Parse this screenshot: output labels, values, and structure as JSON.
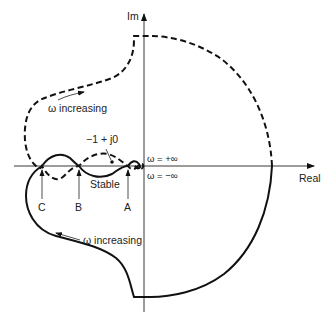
{
  "diagram": {
    "axes": {
      "imaginary_label": "Im",
      "real_label": "Real"
    },
    "annotations": {
      "omega_increasing_upper": "ω increasing",
      "omega_increasing_lower": "ω increasing",
      "critical_point": "−1 + j0",
      "omega_plus_inf": "ω = +∞",
      "omega_minus_inf": "ω = −∞",
      "stable_region": "Stable"
    },
    "crossing_points": [
      {
        "label": "C"
      },
      {
        "label": "B"
      },
      {
        "label": "A"
      }
    ],
    "curves": [
      {
        "name": "positive-frequency-branch",
        "style": "dashed"
      },
      {
        "name": "negative-frequency-branch",
        "style": "solid"
      }
    ],
    "colors": {
      "ink": "#111111",
      "background": "#ffffff"
    }
  }
}
